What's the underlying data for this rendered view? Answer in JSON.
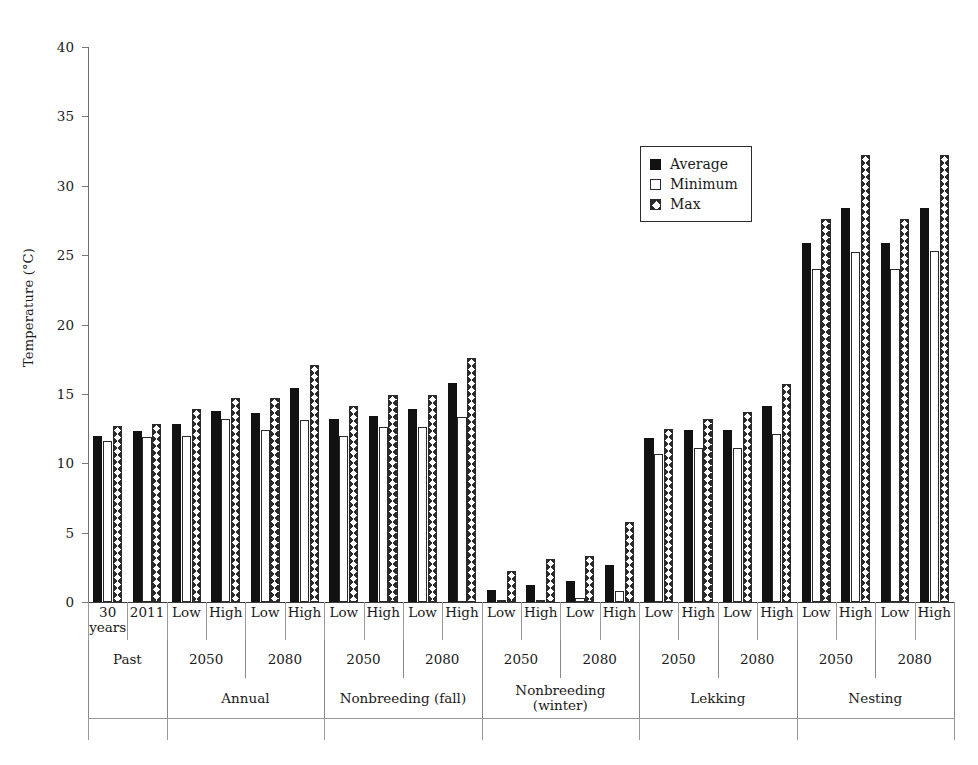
{
  "chart_data": {
    "type": "bar",
    "title": "",
    "xlabel": "",
    "ylabel": "Temperature (°C)",
    "ylim": [
      0,
      40
    ],
    "ytick_step": 5,
    "yticks": [
      0,
      5,
      10,
      15,
      20,
      25,
      30,
      35,
      40
    ],
    "grid": false,
    "legend_position": "upper center-right",
    "series": [
      {
        "name": "Average",
        "key": "average",
        "fill": "solid-black"
      },
      {
        "name": "Minimum",
        "key": "minimum",
        "fill": "white-outline"
      },
      {
        "name": "Max",
        "key": "max",
        "fill": "cross-hatch"
      }
    ],
    "categories": [
      "Past / 30 years",
      "Past / 2011",
      "Annual / 2050 / Low",
      "Annual / 2050 / High",
      "Annual / 2080 / Low",
      "Annual / 2080 / High",
      "Nonbreeding (fall) / 2050 / Low",
      "Nonbreeding (fall) / 2050 / High",
      "Nonbreeding (fall) / 2080 / Low",
      "Nonbreeding (fall) / 2080 / High",
      "Nonbreeding (winter) / 2050 / Low",
      "Nonbreeding (winter) / 2050 / High",
      "Nonbreeding (winter) / 2080 / Low",
      "Nonbreeding (winter) / 2080 / High",
      "Lekking / 2050 / Low",
      "Lekking / 2050 / High",
      "Lekking / 2080 / Low",
      "Lekking / 2080 / High",
      "Nesting / 2050 / Low",
      "Nesting / 2050 / High",
      "Nesting / 2080 / Low",
      "Nesting / 2080 / High"
    ],
    "average": [
      12.0,
      12.3,
      12.8,
      13.8,
      13.6,
      15.4,
      13.2,
      13.4,
      13.9,
      15.8,
      0.9,
      1.2,
      1.5,
      2.7,
      11.8,
      12.4,
      12.4,
      14.1,
      25.9,
      28.4,
      25.9,
      28.4
    ],
    "minimum": [
      11.6,
      11.9,
      12.0,
      13.2,
      12.4,
      13.1,
      12.0,
      12.6,
      12.6,
      13.3,
      0.1,
      0.1,
      0.3,
      0.8,
      10.7,
      11.1,
      11.1,
      12.1,
      24.0,
      25.2,
      24.0,
      25.3
    ],
    "max": [
      12.7,
      12.8,
      13.9,
      14.7,
      14.7,
      17.1,
      14.1,
      14.9,
      14.9,
      17.6,
      2.2,
      3.1,
      3.3,
      5.8,
      12.5,
      13.2,
      13.7,
      15.7,
      27.6,
      32.2,
      27.6,
      32.2
    ],
    "axis_tiers": {
      "level1": [
        "30 years",
        "2011",
        "Low",
        "High",
        "Low",
        "High",
        "Low",
        "High",
        "Low",
        "High",
        "Low",
        "High",
        "Low",
        "High",
        "Low",
        "High",
        "Low",
        "High",
        "Low",
        "High",
        "Low",
        "High"
      ],
      "level2": [
        {
          "label": "Past",
          "span": 2
        },
        {
          "label": "2050",
          "span": 2
        },
        {
          "label": "2080",
          "span": 2
        },
        {
          "label": "2050",
          "span": 2
        },
        {
          "label": "2080",
          "span": 2
        },
        {
          "label": "2050",
          "span": 2
        },
        {
          "label": "2080",
          "span": 2
        },
        {
          "label": "2050",
          "span": 2
        },
        {
          "label": "2080",
          "span": 2
        },
        {
          "label": "2050",
          "span": 2
        },
        {
          "label": "2080",
          "span": 2
        }
      ],
      "level3": [
        {
          "label": "Past",
          "span": 2,
          "hidden": true
        },
        {
          "label": "Annual",
          "span": 4
        },
        {
          "label": "Nonbreeding (fall)",
          "span": 4
        },
        {
          "label": "Nonbreeding (winter)",
          "span": 4
        },
        {
          "label": "Lekking",
          "span": 4
        },
        {
          "label": "Nesting",
          "span": 4
        }
      ]
    }
  },
  "legend": {
    "items": [
      {
        "label": "Average"
      },
      {
        "label": "Minimum"
      },
      {
        "label": "Max"
      }
    ]
  }
}
